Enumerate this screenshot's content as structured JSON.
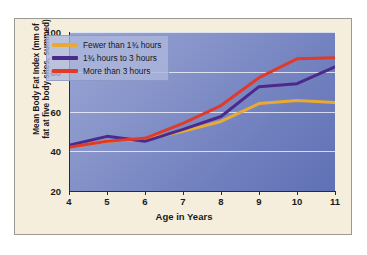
{
  "chart_data": {
    "type": "line",
    "title": "",
    "xlabel": "Age in Years",
    "ylabel": "Mean Body Fat Index (mm of fat at five body sites, summed)",
    "ylabel_line1": "Mean Body Fat Index (mm of",
    "ylabel_line2": "fat at five body sites, summed)",
    "x": [
      4,
      5,
      6,
      7,
      8,
      9,
      10,
      11
    ],
    "xticklabels": [
      "4",
      "5",
      "6",
      "7",
      "8",
      "9",
      "10",
      "11"
    ],
    "yticks": [
      20,
      40,
      60,
      80,
      100
    ],
    "yticklabels": [
      "20",
      "40",
      "60",
      "80",
      "100"
    ],
    "xlim": [
      4,
      11
    ],
    "ylim": [
      20,
      100
    ],
    "grid": true,
    "grid_axis": "y",
    "legend_position": "upper-left-inside",
    "series": [
      {
        "name": "Fewer than 1¾ hours",
        "color": "#e8a935",
        "values": [
          42,
          45,
          46,
          50,
          55,
          64,
          65.5,
          64.5
        ]
      },
      {
        "name": "1¾ hours to 3 hours",
        "color": "#4b2a8c",
        "values": [
          43,
          47.5,
          45,
          51,
          57.5,
          72.5,
          74,
          82.5
        ]
      },
      {
        "name": "More than 3 hours",
        "color": "#e03a29",
        "values": [
          42,
          45,
          46.5,
          54,
          63,
          77,
          86.5,
          87
        ]
      }
    ]
  },
  "axis": {
    "x_title": "Age in Years"
  },
  "legend": {
    "items": [
      {
        "label": "Fewer than 1¾ hours",
        "color": "#e8a935"
      },
      {
        "label": "1¾ hours to 3 hours",
        "color": "#4b2a8c"
      },
      {
        "label": "More than 3 hours",
        "color": "#e03a29"
      }
    ]
  },
  "colors": {
    "page_background": "#ffffff",
    "panel_background": "#f6eedd",
    "panel_border": "#9a9a93",
    "plot_gradient_light": "#9aa6d4",
    "plot_gradient_dark": "#5f70b4",
    "gridline": "#ffffff",
    "axis": "#2b2b2b",
    "text": "#1a1a1a"
  }
}
